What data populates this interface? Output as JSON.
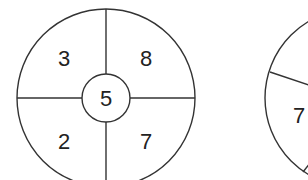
{
  "diagram": {
    "left_circle": {
      "top_left": "3",
      "top_right": "8",
      "bottom_left": "2",
      "bottom_right": "7",
      "center": "5"
    },
    "right_circle": {
      "visible_number": "7"
    },
    "colors": {
      "stroke": "#333333",
      "text": "#222222",
      "background": "#ffffff"
    }
  }
}
